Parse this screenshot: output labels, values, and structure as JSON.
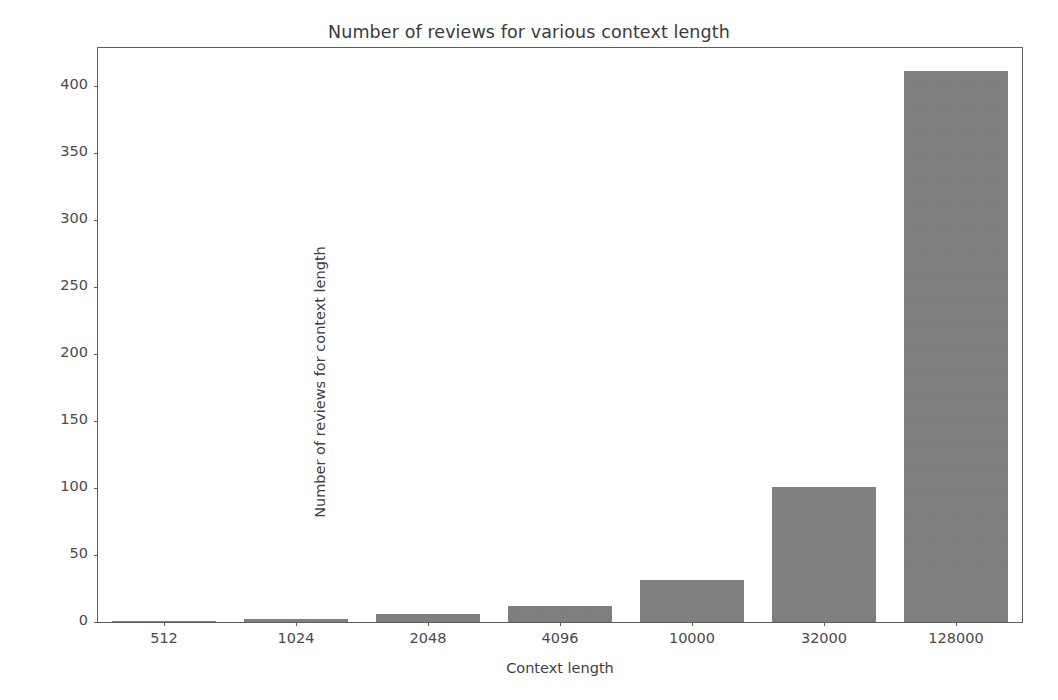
{
  "chart_data": {
    "type": "bar",
    "title": "Number of reviews for various context length",
    "xlabel": "Context length",
    "ylabel": "Number of reviews for context length",
    "categories": [
      "512",
      "1024",
      "2048",
      "4096",
      "10000",
      "32000",
      "128000"
    ],
    "values": [
      1,
      2,
      6,
      12,
      31,
      101,
      411
    ],
    "ylim": [
      0,
      428
    ],
    "yticks": [
      0,
      50,
      100,
      150,
      200,
      250,
      300,
      350,
      400
    ],
    "ytick_labels": [
      "0",
      "50",
      "100",
      "150",
      "200",
      "250",
      "300",
      "350",
      "400"
    ],
    "grid": false,
    "legend": null,
    "bar_color": "#808080",
    "axis_color": "#5c5c5c",
    "text_color": "#3f3f3f",
    "background": "#ffffff"
  }
}
